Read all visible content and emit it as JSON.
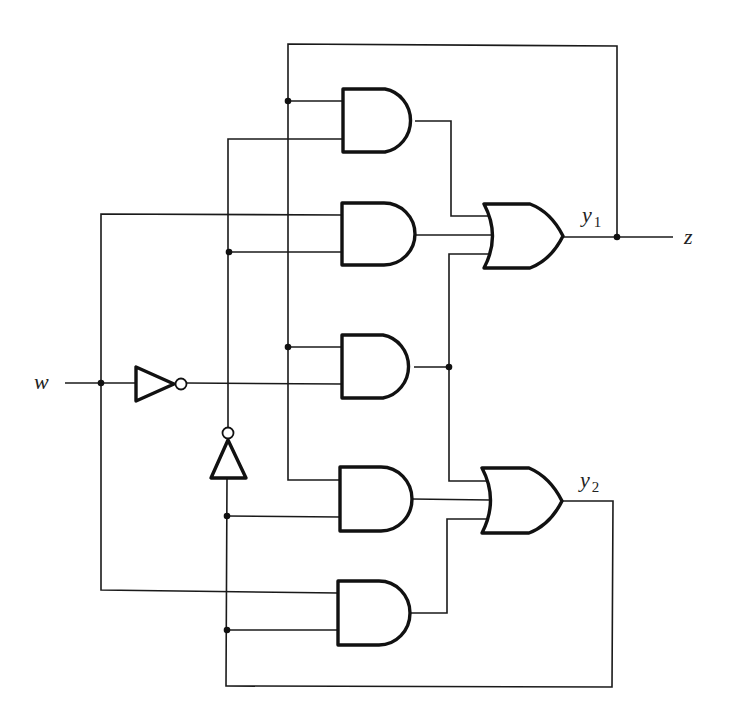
{
  "diagram": {
    "type": "sequential logic circuit",
    "labels": {
      "input_w": "w",
      "output_z": "z",
      "y1_main": "y",
      "y1_sub": "1",
      "y2_main": "y",
      "y2_sub": "2"
    },
    "colors": {
      "line": "#1a1a1a",
      "background": "#ffffff"
    },
    "gates": [
      {
        "id": "and1",
        "type": "AND",
        "inputs": [
          "y1",
          "y2'"
        ],
        "output": "or1"
      },
      {
        "id": "and2",
        "type": "AND",
        "inputs": [
          "w",
          "y2'"
        ],
        "output": "or1"
      },
      {
        "id": "and3",
        "type": "AND",
        "inputs": [
          "y1",
          "w'"
        ],
        "output": "or1, or2"
      },
      {
        "id": "and4",
        "type": "AND",
        "inputs": [
          "y1",
          "y2"
        ],
        "output": "or2"
      },
      {
        "id": "and5",
        "type": "AND",
        "inputs": [
          "w",
          "y2"
        ],
        "output": "or2"
      },
      {
        "id": "or1",
        "type": "OR",
        "inputs": [
          "and1",
          "and2",
          "and3"
        ],
        "output": "y1"
      },
      {
        "id": "or2",
        "type": "OR",
        "inputs": [
          "and3",
          "and4",
          "and5"
        ],
        "output": "y2"
      },
      {
        "id": "not1",
        "type": "NOT",
        "input": "w",
        "output": "w'"
      },
      {
        "id": "not2",
        "type": "NOT",
        "input": "y2",
        "output": "y2'"
      }
    ]
  }
}
